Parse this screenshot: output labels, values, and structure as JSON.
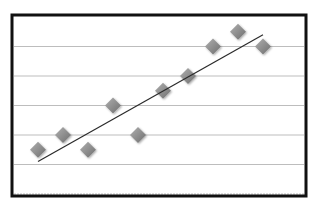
{
  "chart_data": {
    "type": "scatter",
    "title": "",
    "xlabel": "",
    "ylabel": "",
    "x": [
      1,
      2,
      3,
      4,
      5,
      6,
      7,
      8,
      9,
      10
    ],
    "series": [
      {
        "name": "Series 1",
        "marker": "diamond",
        "values": [
          1.5,
          2.0,
          1.5,
          3.0,
          2.0,
          3.5,
          4.0,
          5.0,
          5.5,
          5.0
        ]
      }
    ],
    "trendline": {
      "type": "linear",
      "start": {
        "x": 1,
        "y": 1.1
      },
      "end": {
        "x": 10,
        "y": 5.4
      }
    },
    "ylim": [
      0,
      6
    ],
    "xlim": [
      0,
      11
    ],
    "grid": true,
    "gridlines_y": [
      0,
      1,
      2,
      3,
      4,
      5
    ],
    "legend": false,
    "axis_tick_labels_visible": false
  },
  "style": {
    "frame_color": "#111111",
    "gridline_color": "#bdbdbd",
    "marker_color_light": "#b0b0b0",
    "marker_color_dark": "#6e6e6e",
    "trendline_color": "#2a2a2a",
    "background": "#ffffff"
  }
}
